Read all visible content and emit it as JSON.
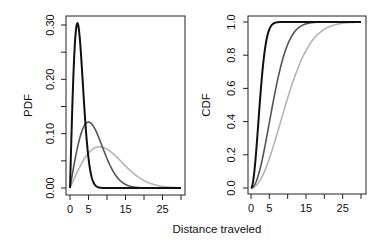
{
  "chart_data": [
    {
      "type": "line",
      "title": "",
      "xlabel": "Distance traveled",
      "ylabel": "PDF",
      "xlim": [
        0,
        30
      ],
      "ylim": [
        0,
        0.3
      ],
      "x_ticks": [
        0,
        5,
        10,
        15,
        20,
        25,
        30
      ],
      "x_tick_labels": [
        "0",
        "5",
        "",
        "15",
        "",
        "25",
        ""
      ],
      "y_ticks": [
        0,
        0.05,
        0.1,
        0.15,
        0.2,
        0.25,
        0.3
      ],
      "y_tick_labels": [
        "0.00",
        "",
        "0.10",
        "",
        "0.20",
        "",
        "0.30"
      ],
      "grid": false,
      "legend": null,
      "series": [
        {
          "name": "sigma=2",
          "distribution": "rayleigh",
          "sigma": 2,
          "color": "#111111",
          "peak": {
            "x": 2,
            "y": 0.303
          }
        },
        {
          "name": "sigma=5",
          "distribution": "rayleigh",
          "sigma": 5,
          "color": "#555555",
          "peak": {
            "x": 5,
            "y": 0.121
          }
        },
        {
          "name": "sigma=8",
          "distribution": "rayleigh",
          "sigma": 8,
          "color": "#b5b5b5",
          "peak": {
            "x": 8,
            "y": 0.076
          }
        }
      ]
    },
    {
      "type": "line",
      "title": "",
      "xlabel": "Distance traveled",
      "ylabel": "CDF",
      "xlim": [
        0,
        30
      ],
      "ylim": [
        0,
        1.0
      ],
      "x_ticks": [
        0,
        5,
        10,
        15,
        20,
        25,
        30
      ],
      "x_tick_labels": [
        "0",
        "5",
        "",
        "15",
        "",
        "25",
        ""
      ],
      "y_ticks": [
        0,
        0.2,
        0.4,
        0.6,
        0.8,
        1.0
      ],
      "y_tick_labels": [
        "0.0",
        "0.2",
        "0.4",
        "0.6",
        "0.8",
        "1.0"
      ],
      "grid": false,
      "legend": null,
      "series": [
        {
          "name": "sigma=2",
          "distribution": "rayleigh",
          "sigma": 2,
          "color": "#111111"
        },
        {
          "name": "sigma=5",
          "distribution": "rayleigh",
          "sigma": 5,
          "color": "#555555"
        },
        {
          "name": "sigma=8",
          "distribution": "rayleigh",
          "sigma": 8,
          "color": "#b5b5b5"
        }
      ]
    }
  ],
  "shared_xlabel": "Distance traveled",
  "panels": [
    {
      "ylabel": "PDF"
    },
    {
      "ylabel": "CDF"
    }
  ]
}
